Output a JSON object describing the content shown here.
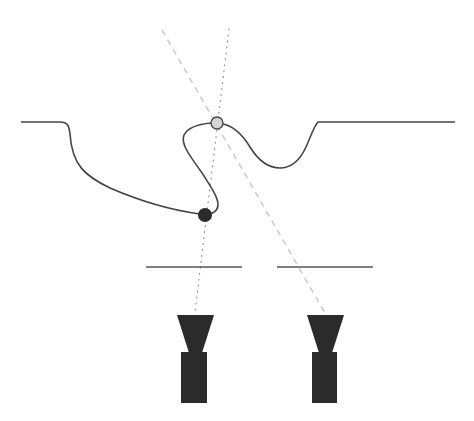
{
  "diagram": {
    "title": "",
    "colors": {
      "background": "#ffffff",
      "surface_line": "#444444",
      "plate_line": "#555555",
      "camera_fill": "#2b2b2b",
      "dashed_ray": "#cccccc",
      "dotted_ray": "#888888",
      "occluded_point_fill": "#d6d6d6",
      "visible_point_fill": "#2b2b2b"
    },
    "surface": {
      "description": "folded surface profile with overhang",
      "left_plateau": {
        "x1": 21,
        "x2": 62,
        "y": 122
      },
      "right_plateau": {
        "x1": 318,
        "x2": 455,
        "y": 122
      }
    },
    "points": [
      {
        "id": "point-top",
        "label": "",
        "cx": 217,
        "cy": 123,
        "r": 6,
        "fill": "#d6d6d6"
      },
      {
        "id": "point-bottom",
        "label": "",
        "cx": 205,
        "cy": 215,
        "r": 7,
        "fill": "#2b2b2b"
      }
    ],
    "rays": [
      {
        "id": "ray-dotted",
        "style": "dotted",
        "x1": 229,
        "y1": 29,
        "x2": 195,
        "y2": 312
      },
      {
        "id": "ray-dashed",
        "style": "dashed",
        "x1": 162,
        "y1": 30,
        "x2": 325,
        "y2": 313
      }
    ],
    "plates": [
      {
        "id": "plate-left",
        "x1": 146,
        "x2": 242,
        "y": 267
      },
      {
        "id": "plate-right",
        "x1": 277,
        "x2": 373,
        "y": 267
      }
    ],
    "cameras": [
      {
        "id": "camera-left",
        "lens_top_x1": 177,
        "lens_top_x2": 214,
        "lens_top_y": 315,
        "lens_bottom_x1": 189,
        "lens_bottom_x2": 202,
        "lens_bottom_y": 353,
        "body_x": 181,
        "body_y": 352,
        "body_w": 26,
        "body_h": 51
      },
      {
        "id": "camera-right",
        "lens_top_x1": 307,
        "lens_top_x2": 344,
        "lens_top_y": 315,
        "lens_bottom_x1": 319,
        "lens_bottom_x2": 332,
        "lens_bottom_y": 353,
        "body_x": 312,
        "body_y": 352,
        "body_w": 25,
        "body_h": 51
      }
    ]
  }
}
